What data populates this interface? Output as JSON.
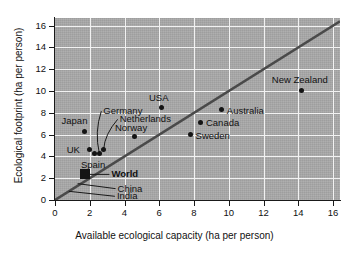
{
  "chart_data": {
    "type": "scatter",
    "title": "",
    "xlabel": "Available ecological capacity (ha per person)",
    "ylabel": "Ecological footprint (ha per person)",
    "xlim": [
      0,
      16.4
    ],
    "ylim": [
      0,
      16.7
    ],
    "xticks": [
      0,
      2,
      4,
      6,
      8,
      10,
      12,
      14,
      16
    ],
    "yticks": [
      0,
      2,
      4,
      6,
      8,
      10,
      12,
      14,
      16
    ],
    "xtick_labels": [
      "0",
      "2",
      "4",
      "6",
      "8",
      "10",
      "12",
      "14",
      "16"
    ],
    "ytick_labels": [
      "0",
      "2",
      "4",
      "6",
      "8",
      "10",
      "12",
      "14",
      "16"
    ],
    "grid": true,
    "grid_color": "#f2f2f2",
    "plot_background": "#a9a9a9",
    "marker_color": "#141414",
    "reference_line": {
      "label": "y = x",
      "type": "line",
      "from": [
        0,
        0
      ],
      "to": [
        16.4,
        16.4
      ],
      "color": "#4a4a4a"
    },
    "points": [
      {
        "name": "Japan",
        "x": 1.7,
        "y": 6.3,
        "marker": "circle",
        "label_dx": -23,
        "label_dy": -16,
        "leader": false
      },
      {
        "name": "UK",
        "x": 2.0,
        "y": 4.65,
        "marker": "circle",
        "label_dx": -23,
        "label_dy": -5,
        "leader": false
      },
      {
        "name": "Spain",
        "x": 2.3,
        "y": 4.3,
        "marker": "circle",
        "label_dx": -14,
        "label_dy": 6,
        "leader": false
      },
      {
        "name": "Germany",
        "x": 2.55,
        "y": 4.3,
        "marker": "circle",
        "label_dx": 4,
        "label_dy": -48,
        "leader": true
      },
      {
        "name": "Netherlands",
        "x": 2.8,
        "y": 4.65,
        "marker": "circle",
        "label_dx": 16,
        "label_dy": -36,
        "leader": true
      },
      {
        "name": "Norway",
        "x": 4.6,
        "y": 5.8,
        "marker": "circle",
        "label_dx": -20,
        "label_dy": -15,
        "leader": false
      },
      {
        "name": "USA",
        "x": 6.1,
        "y": 8.5,
        "marker": "circle",
        "label_dx": -12,
        "label_dy": -15,
        "leader": false
      },
      {
        "name": "Sweden",
        "x": 7.8,
        "y": 6.0,
        "marker": "circle",
        "label_dx": 5,
        "label_dy": -5,
        "leader": false
      },
      {
        "name": "Canada",
        "x": 8.4,
        "y": 7.15,
        "marker": "circle",
        "label_dx": 5,
        "label_dy": -5,
        "leader": false
      },
      {
        "name": "Australia",
        "x": 9.6,
        "y": 8.3,
        "marker": "circle",
        "label_dx": 5,
        "label_dy": -5,
        "leader": false
      },
      {
        "name": "New Zealand",
        "x": 14.2,
        "y": 10.05,
        "marker": "circle",
        "label_dx": -30,
        "label_dy": -16,
        "leader": false
      },
      {
        "name": "World",
        "x": 1.75,
        "y": 2.35,
        "marker": "square",
        "label_dx": 26,
        "label_dy": -6,
        "leader": true,
        "bold": true
      },
      {
        "name": "China",
        "x": 1.3,
        "y": 1.5,
        "marker": "none",
        "label_dx": 40,
        "label_dy": -1,
        "leader": true
      },
      {
        "name": "India",
        "x": 0.8,
        "y": 0.8,
        "marker": "none",
        "label_dx": 48,
        "label_dy": -1,
        "leader": true
      }
    ]
  }
}
